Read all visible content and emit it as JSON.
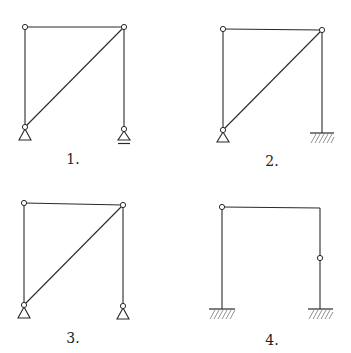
{
  "figure": {
    "diagrams": [
      {
        "id": 1,
        "label": "1.",
        "description": "Truss frame with diagonal; pinned support at left, roller support at right"
      },
      {
        "id": 2,
        "label": "2.",
        "description": "Truss frame with diagonal; pinned support at left, fixed support at right"
      },
      {
        "id": 3,
        "label": "3.",
        "description": "Truss frame with diagonal; pinned supports at both bases"
      },
      {
        "id": 4,
        "label": "4.",
        "description": "Portal frame with hinge at top-left and mid-height hinge on right column; fixed supports at both bases"
      }
    ],
    "colors": {
      "line": "#2a2a2a",
      "hatch": "#777777",
      "background": "#ffffff"
    }
  }
}
